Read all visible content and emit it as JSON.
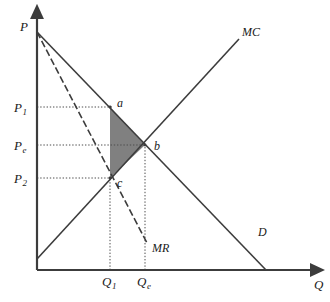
{
  "figure": {
    "type": "economics-diagram",
    "title_fragment": "",
    "background_color": "#ffffff",
    "line_color": "#3c3c3c",
    "shade_color": "#808080",
    "dotted_color": "#4d4d4d"
  },
  "axes": {
    "y_label": "P",
    "x_label": "Q",
    "origin": {
      "x": 37,
      "y": 270
    },
    "y_top": {
      "x": 37,
      "y": 17
    },
    "x_right": {
      "x": 312,
      "y": 270
    }
  },
  "y_ticks": [
    {
      "id": "p1",
      "label": "P",
      "sub": "1",
      "x": 14,
      "y": 101,
      "line_y": 107,
      "line_to_x": 112
    },
    {
      "id": "pe",
      "label": "P",
      "sub": "e",
      "x": 14,
      "y": 139,
      "line_y": 145,
      "line_to_x": 146
    },
    {
      "id": "p2",
      "label": "P",
      "sub": "2",
      "x": 14,
      "y": 172,
      "line_y": 178,
      "line_to_x": 112
    }
  ],
  "x_ticks": [
    {
      "id": "q1",
      "label": "Q",
      "sub": "1",
      "x": 102,
      "y": 275,
      "line_x": 110,
      "line_to_y": 178
    },
    {
      "id": "qe",
      "label": "Q",
      "sub": "e",
      "x": 137,
      "y": 275,
      "line_x": 145,
      "line_to_y": 145
    }
  ],
  "curves": [
    {
      "id": "demand",
      "label": "D",
      "label_x": 258,
      "label_y": 226,
      "from": {
        "x": 37,
        "y": 32
      },
      "to": {
        "x": 266,
        "y": 270
      }
    },
    {
      "id": "marginal-revenue",
      "label": "MR",
      "label_x": 152,
      "label_y": 242,
      "from": {
        "x": 37,
        "y": 32
      },
      "to": {
        "x": 147,
        "y": 243
      },
      "dashed": true
    },
    {
      "id": "marginal-cost",
      "label": "MC",
      "label_x": 242,
      "label_y": 26,
      "from": {
        "x": 37,
        "y": 259
      },
      "to": {
        "x": 239,
        "y": 39
      }
    }
  ],
  "points": [
    {
      "id": "a",
      "label": "a",
      "x": 110,
      "y": 107,
      "label_x": 117,
      "label_y": 97
    },
    {
      "id": "b",
      "label": "b",
      "x": 145,
      "y": 145,
      "label_x": 154,
      "label_y": 140
    },
    {
      "id": "c",
      "label": "c",
      "x": 110,
      "y": 178,
      "label_x": 117,
      "label_y": 177
    }
  ],
  "shaded_region": {
    "id": "deadweight-loss-triangle",
    "vertices": [
      {
        "x": 110,
        "y": 107
      },
      {
        "x": 145,
        "y": 145
      },
      {
        "x": 110,
        "y": 178
      }
    ],
    "fill": "#808080"
  }
}
